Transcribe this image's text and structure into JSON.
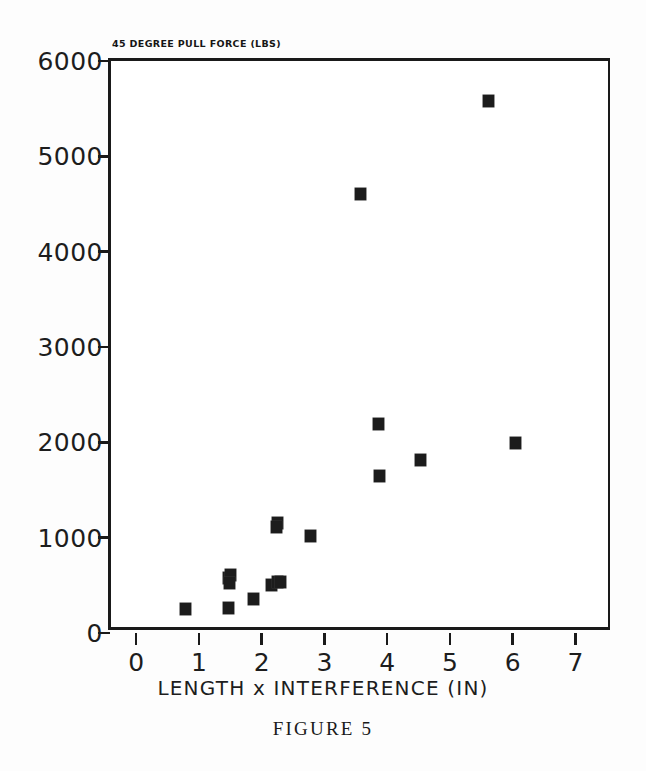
{
  "chart_data": {
    "type": "scatter",
    "title": "45 DEGREE PULL FORCE (LBS)",
    "xlabel": "LENGTH x INTERFERENCE (IN)",
    "ylabel": "",
    "caption": "FIGURE 5",
    "xlim": [
      -0.4,
      7.6
    ],
    "ylim": [
      0,
      6000
    ],
    "xticks": [
      0,
      1,
      2,
      3,
      4,
      5,
      6,
      7
    ],
    "xtick_labels": [
      "0",
      "1",
      "2",
      "3",
      "4",
      "5",
      "6",
      "7"
    ],
    "yticks": [
      0,
      1000,
      2000,
      3000,
      4000,
      5000,
      6000
    ],
    "ytick_labels": [
      "0",
      "1000",
      "2000",
      "3000",
      "4000",
      "5000",
      "6000"
    ],
    "grid": false,
    "legend": null,
    "marker": "filled-square",
    "marker_color": "#1c1c1c",
    "points": [
      {
        "x": 0.79,
        "y": 250
      },
      {
        "x": 1.47,
        "y": 580
      },
      {
        "x": 1.5,
        "y": 610
      },
      {
        "x": 1.49,
        "y": 520
      },
      {
        "x": 1.48,
        "y": 265
      },
      {
        "x": 1.87,
        "y": 355
      },
      {
        "x": 2.16,
        "y": 500
      },
      {
        "x": 2.25,
        "y": 540
      },
      {
        "x": 2.3,
        "y": 530
      },
      {
        "x": 2.26,
        "y": 1150
      },
      {
        "x": 2.24,
        "y": 1115
      },
      {
        "x": 2.78,
        "y": 1020
      },
      {
        "x": 3.58,
        "y": 4600
      },
      {
        "x": 3.86,
        "y": 2190
      },
      {
        "x": 3.88,
        "y": 1650
      },
      {
        "x": 4.53,
        "y": 1810
      },
      {
        "x": 5.62,
        "y": 5580
      },
      {
        "x": 6.05,
        "y": 1990
      }
    ]
  }
}
